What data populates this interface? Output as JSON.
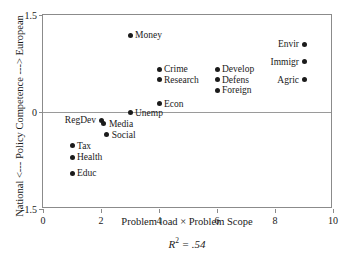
{
  "chart_data": {
    "type": "scatter",
    "title": "",
    "xlabel": "Problem load × Problem Scope",
    "ylabel": "National <--- Policy Competence ---> European",
    "xlim": [
      0,
      10
    ],
    "ylim": [
      -1.5,
      1.5
    ],
    "xticks": [
      "0",
      "2",
      "4",
      "6",
      "8",
      "10"
    ],
    "xtick_values": [
      0,
      2,
      4,
      6,
      8,
      10
    ],
    "yticks": [
      "1.5",
      "0",
      "-1.5"
    ],
    "ytick_values": [
      1.5,
      0,
      -1.5
    ],
    "grid": false,
    "legend": "none",
    "zero_line": true,
    "annotation": "R² = .54",
    "annotation_symbol": "R",
    "annotation_exponent": "2",
    "annotation_value": "= .54",
    "points": [
      {
        "label": "Money",
        "x": 3.0,
        "y": 1.19,
        "label_side": "right"
      },
      {
        "label": "Envir",
        "x": 9.0,
        "y": 1.05,
        "label_side": "left"
      },
      {
        "label": "Immigr",
        "x": 9.0,
        "y": 0.78,
        "label_side": "left"
      },
      {
        "label": "Crime",
        "x": 4.0,
        "y": 0.66,
        "label_side": "right"
      },
      {
        "label": "Develop",
        "x": 6.0,
        "y": 0.66,
        "label_side": "right"
      },
      {
        "label": "Research",
        "x": 4.0,
        "y": 0.5,
        "label_side": "right"
      },
      {
        "label": "Defens",
        "x": 6.0,
        "y": 0.5,
        "label_side": "right"
      },
      {
        "label": "Agric",
        "x": 9.0,
        "y": 0.5,
        "label_side": "left"
      },
      {
        "label": "Foreign",
        "x": 6.0,
        "y": 0.34,
        "label_side": "right"
      },
      {
        "label": "Econ",
        "x": 4.0,
        "y": 0.13,
        "label_side": "right"
      },
      {
        "label": "Unemp",
        "x": 3.0,
        "y": -0.01,
        "label_side": "right"
      },
      {
        "label": "RegDev",
        "x": 2.0,
        "y": -0.13,
        "label_side": "left"
      },
      {
        "label": "Media",
        "x": 2.1,
        "y": -0.18,
        "label_side": "right"
      },
      {
        "label": "Social",
        "x": 2.2,
        "y": -0.35,
        "label_side": "right"
      },
      {
        "label": "Tax",
        "x": 1.0,
        "y": -0.52,
        "label_side": "right"
      },
      {
        "label": "Health",
        "x": 1.0,
        "y": -0.7,
        "label_side": "right"
      },
      {
        "label": "Educ",
        "x": 1.0,
        "y": -0.95,
        "label_side": "right"
      }
    ]
  }
}
